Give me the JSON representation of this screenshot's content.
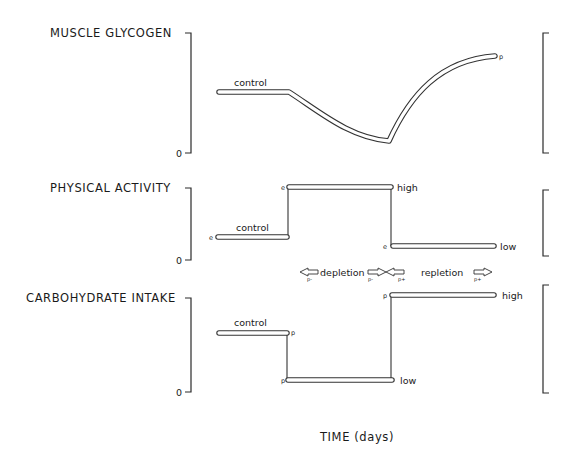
{
  "panels": [
    {
      "id": "muscle-glycogen",
      "title": "MUSCLE GLYCOGEN",
      "zero_label": "0",
      "segments": [
        {
          "label": "control",
          "start_marker": "",
          "end_marker": ""
        },
        {
          "label": "",
          "end_marker": "p"
        }
      ]
    },
    {
      "id": "physical-activity",
      "title": "PHYSICAL ACTIVITY",
      "zero_label": "0",
      "control_label": "control",
      "control_marker": "e",
      "high_marker": "e",
      "high_label": "high",
      "low_marker": "e",
      "low_label": "low"
    },
    {
      "id": "carbohydrate-intake",
      "title": "CARBOHYDRATE INTAKE",
      "zero_label": "0",
      "control_label": "control",
      "control_marker": "p",
      "low_marker": "p",
      "low_label": "low",
      "high_marker": "p",
      "high_label": "high"
    }
  ],
  "phases": {
    "depletion_label": "depletion",
    "repletion_label": "repletion",
    "arrow_marks": [
      "p-",
      "p-",
      "p+",
      "p+"
    ]
  },
  "x_axis_label": "TIME (days)"
}
